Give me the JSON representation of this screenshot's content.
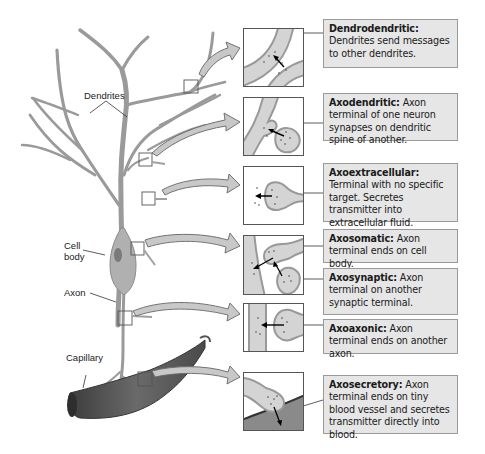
{
  "labels": {
    "dendrites": "Dendrites",
    "cell_body_line1": "Cell",
    "cell_body_line2": "body",
    "axon": "Axon",
    "capillary": "Capillary"
  },
  "synapse_types": [
    {
      "term": "Dendrodendritic:",
      "text": " Dendrites send messages to other dendrites.",
      "icon": "dendrodendritic-synapse-icon"
    },
    {
      "term": "Axodendritic:",
      "text": " Axon terminal of one neuron synapses on dendritic spine of another.",
      "icon": "axodendritic-synapse-icon"
    },
    {
      "term": "Axoextracellular:",
      "text": " Terminal with no specific target. Secretes transmitter into extracellular fluid.",
      "icon": "axoextracellular-synapse-icon"
    },
    {
      "term": "Axosomatic:",
      "text": " Axon terminal ends on cell body.",
      "icon": "axosomatic-synapse-icon"
    },
    {
      "term": "Axosynaptic:",
      "text": " Axon terminal on another synaptic terminal.",
      "icon": "axosynaptic-synapse-icon"
    },
    {
      "term": "Axoaxonic:",
      "text": " Axon terminal ends on another axon.",
      "icon": "axoaxonic-synapse-icon"
    },
    {
      "term": "Axosecretory:",
      "text": " Axon terminal ends on tiny blood vessel and secretes transmitter directly into blood.",
      "icon": "axosecretory-synapse-icon"
    }
  ],
  "colors": {
    "neuron": "#9a9a9a",
    "neuron_dark": "#7a7a7a",
    "arrow_fill": "#c8c8c8",
    "box_fill": "#e6e6e6",
    "box_border": "#9a9a9a",
    "capillary": "#5a5a5a"
  }
}
